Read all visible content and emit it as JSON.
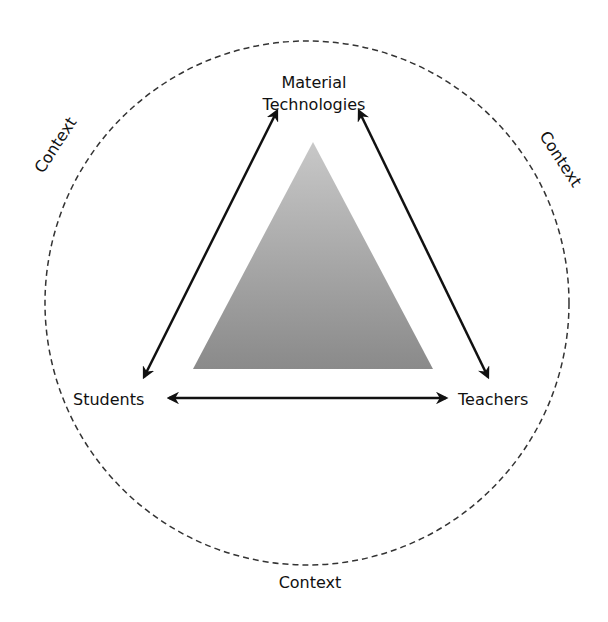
{
  "diagram": {
    "nodes": {
      "top_line1": "Material",
      "top_line2": "Technologies",
      "left": "Students",
      "right": "Teachers"
    },
    "context_labels": {
      "upper_left": "Context",
      "upper_right": "Context",
      "bottom": "Context"
    },
    "relations": [
      {
        "from": "Students",
        "to": "Material Technologies",
        "type": "bidirectional"
      },
      {
        "from": "Material Technologies",
        "to": "Teachers",
        "type": "bidirectional"
      },
      {
        "from": "Students",
        "to": "Teachers",
        "type": "bidirectional"
      }
    ],
    "colors": {
      "triangle_top": "#c4c4c4",
      "triangle_bottom": "#8c8c8c",
      "arrow": "#111111",
      "circle": "#333333"
    }
  }
}
